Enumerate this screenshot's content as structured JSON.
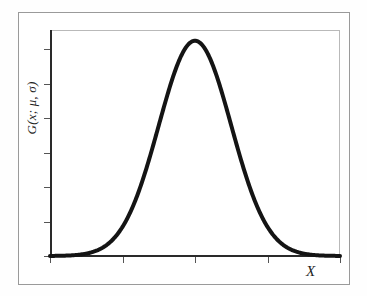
{
  "figure": {
    "background_color": "#fefefe",
    "outer_frame_color": "#9a9a9a",
    "plot_box_color": "#b9b9b9",
    "axis_color": "#2a2a2a",
    "curve_color": "#141414"
  },
  "labels": {
    "y_axis": "G(x; μ, σ)",
    "x_axis": "X"
  },
  "chart_data": {
    "type": "line",
    "title": "",
    "subtitle": "",
    "xlabel": "X",
    "ylabel": "G(x; μ, σ)",
    "legend": [],
    "legend_position": "none",
    "grid": false,
    "xlim": [
      -4,
      4
    ],
    "ylim": [
      0,
      1.05
    ],
    "x_tick_labels": [
      "",
      "",
      "",
      "",
      ""
    ],
    "y_tick_labels": [
      "",
      "",
      "",
      "",
      "",
      "",
      ""
    ],
    "x_ticks": [
      -4,
      -2,
      0,
      2,
      4
    ],
    "y_ticks": [
      0,
      0.16,
      0.32,
      0.48,
      0.64,
      0.8,
      0.96
    ],
    "series": [
      {
        "name": "Gaussian G(x; μ, σ)",
        "mu": 0,
        "sigma": 1,
        "peak_value": 1.0,
        "peak_x": 0,
        "color": "#141414",
        "line_width": 4,
        "x": [
          -4.0,
          -3.8,
          -3.6,
          -3.4,
          -3.2,
          -3.0,
          -2.8,
          -2.6,
          -2.4,
          -2.2,
          -2.0,
          -1.8,
          -1.6,
          -1.4,
          -1.2,
          -1.0,
          -0.8,
          -0.6,
          -0.4,
          -0.2,
          0.0,
          0.2,
          0.4,
          0.6,
          0.8,
          1.0,
          1.2,
          1.4,
          1.6,
          1.8,
          2.0,
          2.2,
          2.4,
          2.6,
          2.8,
          3.0,
          3.2,
          3.4,
          3.6,
          3.8,
          4.0
        ],
        "y": [
          0.000335,
          0.00073,
          0.001534,
          0.0031,
          0.006042,
          0.011109,
          0.019841,
          0.034047,
          0.056135,
          0.088922,
          0.135335,
          0.197899,
          0.278037,
          0.375311,
          0.486752,
          0.606531,
          0.726149,
          0.83527,
          0.923116,
          0.980199,
          1.0,
          0.980199,
          0.923116,
          0.83527,
          0.726149,
          0.606531,
          0.486752,
          0.375311,
          0.278037,
          0.197899,
          0.135335,
          0.088922,
          0.056135,
          0.034047,
          0.019841,
          0.011109,
          0.006042,
          0.0031,
          0.001534,
          0.00073,
          0.000335
        ]
      }
    ]
  },
  "geometry": {
    "plot_left": 50,
    "plot_right": 340,
    "plot_top": 30,
    "plot_bottom": 256,
    "curve_baseline_y": 255,
    "curve_peak_y": 66,
    "curve_peak_x": 193
  }
}
